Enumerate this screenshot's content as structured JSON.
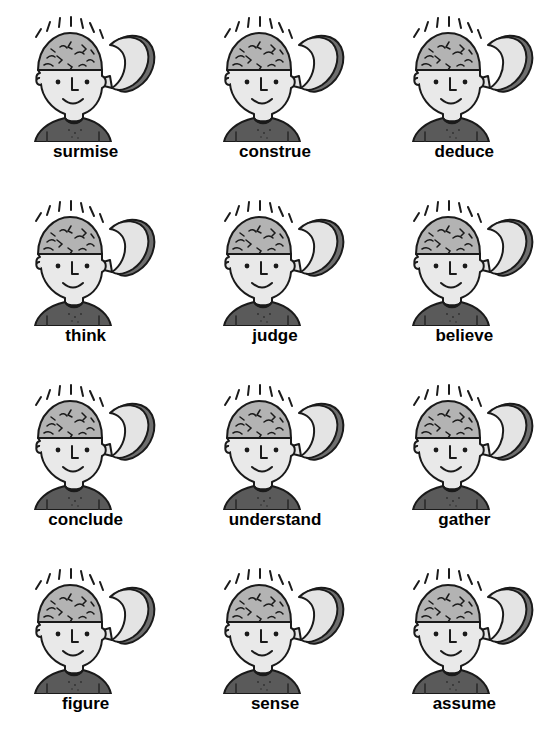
{
  "page": {
    "background_color": "#ffffff",
    "columns": 3,
    "rows": 4
  },
  "illustration": {
    "name": "head-with-open-skull-brain",
    "description": "Cartoon head with the top of the skull hinged open like a lid, revealing a brain inside, with radiating idea lines above",
    "colors": {
      "outline": "#1a1a1a",
      "face_fill": "#e9e9e9",
      "brain_fill": "#b3b3b3",
      "lid_fill": "#e4e4e4",
      "lid_rim": "#6e6e6e",
      "shirt_fill": "#5a5a5a",
      "label_text": "#000000"
    }
  },
  "cells": [
    {
      "index": 1,
      "row": 1,
      "col": 1,
      "label": "surmise"
    },
    {
      "index": 2,
      "row": 1,
      "col": 2,
      "label": "construe"
    },
    {
      "index": 3,
      "row": 1,
      "col": 3,
      "label": "deduce"
    },
    {
      "index": 4,
      "row": 2,
      "col": 1,
      "label": "think"
    },
    {
      "index": 5,
      "row": 2,
      "col": 2,
      "label": "judge"
    },
    {
      "index": 6,
      "row": 2,
      "col": 3,
      "label": "believe"
    },
    {
      "index": 7,
      "row": 3,
      "col": 1,
      "label": "conclude"
    },
    {
      "index": 8,
      "row": 3,
      "col": 2,
      "label": "understand"
    },
    {
      "index": 9,
      "row": 3,
      "col": 3,
      "label": "gather"
    },
    {
      "index": 10,
      "row": 4,
      "col": 1,
      "label": "figure"
    },
    {
      "index": 11,
      "row": 4,
      "col": 2,
      "label": "sense"
    },
    {
      "index": 12,
      "row": 4,
      "col": 3,
      "label": "assume"
    }
  ]
}
